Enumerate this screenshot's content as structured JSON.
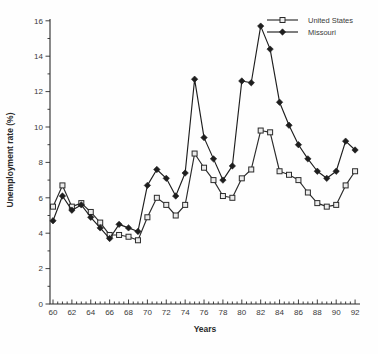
{
  "figure": {
    "background": "#fefefe",
    "line_color": "#2b2b2b",
    "text_color": "#3a3a3a"
  },
  "legend": {
    "items": [
      {
        "label": "United States",
        "marker": "open-square"
      },
      {
        "label": "Missouri",
        "marker": "filled-diamond"
      }
    ]
  },
  "chart_data": {
    "type": "line",
    "title": "",
    "xlabel": "Years",
    "ylabel": "Unemployment rate (%)",
    "x": [
      1960,
      1961,
      1962,
      1963,
      1964,
      1965,
      1966,
      1967,
      1968,
      1969,
      1970,
      1971,
      1972,
      1973,
      1974,
      1975,
      1976,
      1977,
      1978,
      1979,
      1980,
      1981,
      1982,
      1983,
      1984,
      1985,
      1986,
      1987,
      1988,
      1989,
      1990,
      1991,
      1992
    ],
    "x_major_tick_labels": [
      "60",
      "62",
      "64",
      "66",
      "68",
      "70",
      "72",
      "74",
      "76",
      "78",
      "80",
      "82",
      "84",
      "86",
      "88",
      "90",
      "92"
    ],
    "x_major_tick_years": [
      1960,
      1962,
      1964,
      1966,
      1968,
      1970,
      1972,
      1974,
      1976,
      1978,
      1980,
      1982,
      1984,
      1986,
      1988,
      1990,
      1992
    ],
    "x_minor_tick_step_years": 0.5,
    "ylim": [
      0,
      16
    ],
    "y_major_ticks": [
      0,
      2,
      4,
      6,
      8,
      10,
      12,
      14,
      16
    ],
    "y_minor_tick_step": 1,
    "grid": false,
    "legend_position": "top-right",
    "series": [
      {
        "name": "United States",
        "marker": "open-square",
        "marker_fill": "#ececec",
        "color": "#2b2b2b",
        "values": [
          5.5,
          6.7,
          5.5,
          5.7,
          5.2,
          4.6,
          3.9,
          3.9,
          3.8,
          3.6,
          4.9,
          6.0,
          5.6,
          5.0,
          5.6,
          8.5,
          7.7,
          7.0,
          6.1,
          6.0,
          7.1,
          7.6,
          9.8,
          9.7,
          7.5,
          7.3,
          7.0,
          6.3,
          5.7,
          5.5,
          5.6,
          6.7,
          7.5
        ]
      },
      {
        "name": "Missouri",
        "marker": "filled-diamond",
        "marker_fill": "#1e1e1e",
        "color": "#1e1e1e",
        "values": [
          4.7,
          6.1,
          5.3,
          5.6,
          4.9,
          4.3,
          3.7,
          4.5,
          4.3,
          4.1,
          6.7,
          7.6,
          7.1,
          6.1,
          7.4,
          12.7,
          9.4,
          8.2,
          7.0,
          7.8,
          12.6,
          12.5,
          15.7,
          14.4,
          11.4,
          10.1,
          9.0,
          8.2,
          7.5,
          7.1,
          7.5,
          9.2,
          8.7
        ]
      }
    ]
  }
}
